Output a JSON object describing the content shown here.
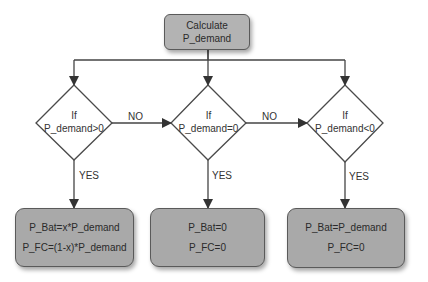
{
  "colors": {
    "process_fill": "#a9a9a9",
    "process_border": "#5a5a5a",
    "line": "#444444",
    "text": "#2a2a2a"
  },
  "start": {
    "line1": "Calculate",
    "line2": "P_demand"
  },
  "decisions": [
    {
      "line1": "If",
      "line2": "P_demand>0"
    },
    {
      "line1": "If",
      "line2": "P_demand=0"
    },
    {
      "line1": "If",
      "line2": "P_demand<0"
    }
  ],
  "edges": {
    "no_1": "NO",
    "no_2": "NO",
    "yes_1": "YES",
    "yes_2": "YES",
    "yes_3": "YES"
  },
  "outcomes": [
    {
      "line1": "P_Bat=x*P_demand",
      "line2": "P_FC=(1-x)*P_demand"
    },
    {
      "line1": "P_Bat=0",
      "line2": "P_FC=0"
    },
    {
      "line1": "P_Bat=P_demand",
      "line2": "P_FC=0"
    }
  ]
}
